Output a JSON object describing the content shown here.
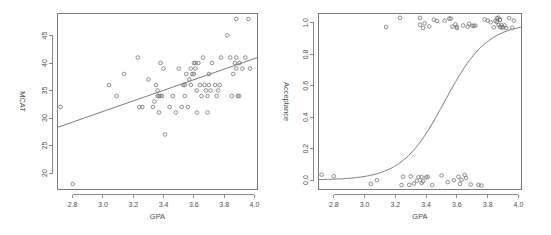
{
  "figure": {
    "background_color": "#ffffff",
    "ink_color": "#6b6b6b",
    "text_color": "#4d4d4d",
    "panel_count": 2
  },
  "chart_data": [
    {
      "type": "scatter",
      "title": "",
      "xlabel": "GPA",
      "ylabel": "MCAT",
      "xlim": [
        2.7,
        4.02
      ],
      "ylim": [
        17.0,
        49.0
      ],
      "xticks": [
        "2.8",
        "3.0",
        "3.2",
        "3.4",
        "3.6",
        "3.8",
        "4.0"
      ],
      "xtick_values": [
        2.8,
        3.0,
        3.2,
        3.4,
        3.6,
        3.8,
        4.0
      ],
      "yticks": [
        "20",
        "25",
        "30",
        "35",
        "40",
        "45"
      ],
      "ytick_values": [
        20,
        25,
        30,
        35,
        40,
        45
      ],
      "grid": false,
      "legend": "none",
      "frame": "box",
      "x": [
        2.72,
        2.8,
        3.04,
        3.09,
        3.14,
        3.23,
        3.24,
        3.26,
        3.3,
        3.33,
        3.34,
        3.35,
        3.36,
        3.36,
        3.37,
        3.37,
        3.38,
        3.38,
        3.39,
        3.4,
        3.41,
        3.44,
        3.46,
        3.48,
        3.5,
        3.52,
        3.53,
        3.54,
        3.54,
        3.55,
        3.56,
        3.57,
        3.58,
        3.58,
        3.59,
        3.6,
        3.6,
        3.61,
        3.61,
        3.62,
        3.62,
        3.63,
        3.64,
        3.65,
        3.66,
        3.67,
        3.68,
        3.69,
        3.69,
        3.7,
        3.7,
        3.71,
        3.72,
        3.74,
        3.75,
        3.76,
        3.77,
        3.78,
        3.82,
        3.84,
        3.85,
        3.86,
        3.87,
        3.88,
        3.88,
        3.88,
        3.89,
        3.9,
        3.9,
        3.92,
        3.94,
        3.96,
        3.97
      ],
      "y": [
        32,
        18,
        36,
        34,
        38,
        41,
        32,
        32,
        37,
        32,
        33,
        36,
        35,
        34,
        34,
        31,
        34,
        40,
        34,
        39,
        27,
        32,
        34,
        31,
        39,
        32,
        36,
        36,
        34,
        38,
        32,
        37,
        39,
        36,
        38,
        40,
        38,
        40,
        39,
        35,
        31,
        40,
        36,
        34,
        41,
        36,
        35,
        31,
        34,
        36,
        38,
        35,
        40,
        36,
        34,
        35,
        36,
        41,
        45,
        41,
        34,
        38,
        40,
        48,
        41,
        39,
        34,
        40,
        34,
        39,
        41,
        48,
        39
      ],
      "fit_line": {
        "kind": "linear-regression",
        "x_start": 2.7,
        "y_start": 28.3,
        "x_end": 4.02,
        "y_end": 41.0
      }
    },
    {
      "type": "scatter",
      "title": "",
      "xlabel": "GPA",
      "ylabel": "Acceptance",
      "xlim": [
        2.7,
        4.02
      ],
      "ylim": [
        -0.06,
        1.06
      ],
      "xticks": [
        "2.8",
        "3.0",
        "3.2",
        "3.4",
        "3.6",
        "3.8",
        "4.0"
      ],
      "xtick_values": [
        2.8,
        3.0,
        3.2,
        3.4,
        3.6,
        3.8,
        4.0
      ],
      "yticks": [
        "0.0",
        "0.2",
        "0.4",
        "0.6",
        "0.8",
        "1.0"
      ],
      "ytick_values": [
        0.0,
        0.2,
        0.4,
        0.6,
        0.8,
        1.0
      ],
      "grid": false,
      "legend": "none",
      "frame": "box",
      "x": [
        2.72,
        2.8,
        3.04,
        3.08,
        3.14,
        3.23,
        3.24,
        3.25,
        3.29,
        3.3,
        3.32,
        3.34,
        3.35,
        3.36,
        3.36,
        3.37,
        3.37,
        3.38,
        3.38,
        3.39,
        3.4,
        3.41,
        3.42,
        3.44,
        3.45,
        3.47,
        3.5,
        3.52,
        3.54,
        3.55,
        3.56,
        3.57,
        3.58,
        3.59,
        3.6,
        3.6,
        3.61,
        3.62,
        3.63,
        3.64,
        3.65,
        3.66,
        3.67,
        3.68,
        3.69,
        3.7,
        3.71,
        3.72,
        3.74,
        3.76,
        3.78,
        3.8,
        3.82,
        3.84,
        3.85,
        3.86,
        3.86,
        3.87,
        3.87,
        3.88,
        3.88,
        3.88,
        3.89,
        3.89,
        3.9,
        3.91,
        3.92,
        3.94,
        3.96,
        3.97
      ],
      "y": [
        0,
        0,
        0,
        0,
        1,
        1,
        0,
        0,
        0,
        0,
        0,
        0,
        0,
        1,
        1,
        0,
        0,
        1,
        0,
        1,
        0,
        0,
        1,
        0,
        1,
        1,
        0,
        1,
        0,
        1,
        1,
        1,
        0,
        1,
        1,
        1,
        0,
        0,
        0,
        1,
        0,
        0,
        1,
        1,
        0,
        1,
        1,
        1,
        0,
        0,
        1,
        1,
        1,
        1,
        1,
        1,
        1,
        1,
        1,
        1,
        1,
        1,
        1,
        1,
        1,
        1,
        1,
        1,
        1,
        1
      ],
      "jitter_note": "binary outcome points jittered vertically",
      "fit_line": {
        "kind": "logistic-regression",
        "midpoint_x": 3.52,
        "steepness": 7.2,
        "y_at_xmin": 0.015,
        "y_at_xmax": 0.94
      }
    }
  ]
}
